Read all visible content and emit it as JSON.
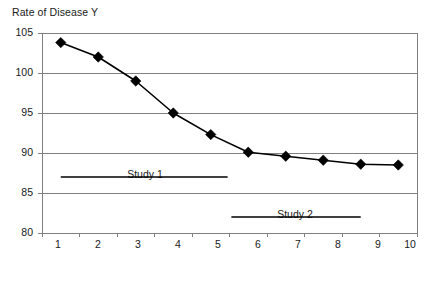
{
  "chart_data": {
    "type": "line",
    "title": "Rate of Disease Y",
    "xlabel": "Dose of Physical Activity Component",
    "ylabel": "Rate of Disease Y",
    "x": [
      1,
      2,
      3,
      4,
      5,
      6,
      7,
      8,
      9,
      10
    ],
    "values": [
      103.8,
      102.0,
      99.0,
      95.0,
      92.3,
      90.1,
      89.6,
      89.1,
      88.6,
      88.5
    ],
    "categories": [
      "1",
      "2",
      "3",
      "4",
      "5",
      "6",
      "7",
      "8",
      "9",
      "10"
    ],
    "xticklabels": [
      "1",
      "2",
      "3",
      "4",
      "5",
      "6",
      "7",
      "8",
      "9",
      "10"
    ],
    "yticklabels": [
      "105",
      "100",
      "95",
      "90",
      "85",
      "80"
    ],
    "yticks": [
      105,
      100,
      95,
      90,
      85,
      80
    ],
    "ylim": [
      80,
      105
    ],
    "xlim": [
      0.5,
      10.5
    ],
    "grid": "horizontal",
    "legend": "none",
    "marker": "diamond",
    "series_color": "#000000",
    "gridline_color": "#808080",
    "frame_color": "#808080",
    "annotations": [
      {
        "label": "Study 1",
        "x_start": 1.0,
        "x_end": 5.45,
        "y": 87.0
      },
      {
        "label": "Study 2",
        "x_start": 5.55,
        "x_end": 9.0,
        "y": 82.0
      }
    ]
  },
  "annotation_labels": {
    "study1": "Study 1",
    "study2": "Study 2"
  },
  "yticks": {
    "t0": "105",
    "t1": "100",
    "t2": "95",
    "t3": "90",
    "t4": "85",
    "t5": "80"
  },
  "xticks": {
    "t0": "1",
    "t1": "2",
    "t2": "3",
    "t3": "4",
    "t4": "5",
    "t5": "6",
    "t6": "7",
    "t7": "8",
    "t8": "9",
    "t9": "10"
  }
}
